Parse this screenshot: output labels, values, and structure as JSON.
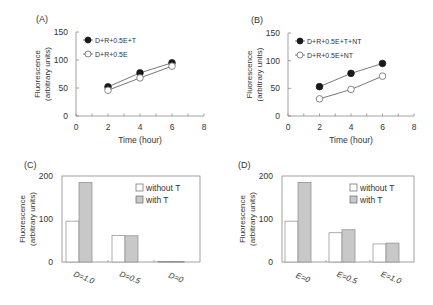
{
  "figure": {
    "panels": [
      "(A)",
      "(B)",
      "(C)",
      "(D)"
    ]
  },
  "chart_data": [
    {
      "panel": "(A)",
      "type": "line",
      "xlabel": "Time (hour)",
      "ylabel": "Fluorescence (arbitrary units)",
      "ylabel_lines": [
        "Fluorescence",
        "(arbitrary units)"
      ],
      "xlim": [
        0,
        8
      ],
      "ylim": [
        0,
        150
      ],
      "xticks": [
        0,
        2,
        4,
        6,
        8
      ],
      "yticks": [
        0,
        50,
        100,
        150
      ],
      "grid": false,
      "legend_position": "upper left",
      "x": [
        2,
        4,
        6
      ],
      "series": [
        {
          "name": "D+R+0.5E+T",
          "marker": "filled-circle",
          "values": [
            52,
            77,
            95
          ]
        },
        {
          "name": "D+R+0.5E",
          "marker": "open-circle",
          "values": [
            46,
            68,
            89
          ]
        }
      ]
    },
    {
      "panel": "(B)",
      "type": "line",
      "xlabel": "Time (hour)",
      "ylabel": "Fluorescence (arbitrary units)",
      "ylabel_lines": [
        "Fluorescence",
        "(arbitrary units)"
      ],
      "xlim": [
        0,
        8
      ],
      "ylim": [
        0,
        150
      ],
      "xticks": [
        0,
        2,
        4,
        6,
        8
      ],
      "yticks": [
        0,
        50,
        100,
        150
      ],
      "grid": false,
      "legend_position": "upper left",
      "x": [
        2,
        4,
        6
      ],
      "series": [
        {
          "name": "D+R+0.5E+T+NT",
          "marker": "filled-circle",
          "values": [
            53,
            77,
            95
          ]
        },
        {
          "name": "D+R+0.5E+NT",
          "marker": "open-circle",
          "values": [
            31,
            48,
            72
          ]
        }
      ]
    },
    {
      "panel": "(C)",
      "type": "bar",
      "xlabel": "",
      "ylabel": "Fluorescence (arbitrary units)",
      "ylabel_lines": [
        "Fluorescence",
        "(arbitrary units)"
      ],
      "ylim": [
        0,
        200
      ],
      "yticks": [
        0,
        100,
        200
      ],
      "grid": false,
      "legend_position": "upper right",
      "categories": [
        "D=1.0",
        "D=0.5",
        "D=0"
      ],
      "series": [
        {
          "name": "without T",
          "color": "#ffffff",
          "values": [
            95,
            62,
            1
          ]
        },
        {
          "name": "with T",
          "color": "#c8c8c8",
          "values": [
            185,
            61,
            1
          ]
        }
      ]
    },
    {
      "panel": "(D)",
      "type": "bar",
      "xlabel": "",
      "ylabel": "Fluorescence (arbitrary units)",
      "ylabel_lines": [
        "Fluorescence",
        "(arbitrary units)"
      ],
      "ylim": [
        0,
        200
      ],
      "yticks": [
        0,
        100,
        200
      ],
      "grid": false,
      "legend_position": "upper right",
      "categories": [
        "E=0",
        "E=0.5",
        "E=1.0"
      ],
      "series": [
        {
          "name": "without T",
          "color": "#ffffff",
          "values": [
            95,
            68,
            42
          ]
        },
        {
          "name": "with T",
          "color": "#c8c8c8",
          "values": [
            185,
            75,
            44
          ]
        }
      ]
    }
  ],
  "style": {
    "axis_color": "#8a8a8a",
    "line_color": "#555555",
    "marker_fill": "#1a1a1a",
    "text_color": "#333333",
    "bar_border": "#8a8a8a"
  }
}
